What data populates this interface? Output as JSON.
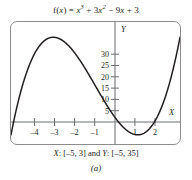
{
  "figure": {
    "title_plain": "f(x) = x^3 + 3x^2 - 9x + 3",
    "title_parts": {
      "fx": "f",
      "paren_open": "(",
      "var1": "x",
      "paren_close": ")",
      "equals": " = ",
      "term1_base": "x",
      "term1_exp": "3",
      "plus1": " + 3",
      "term2_base": "x",
      "term2_exp": "2",
      "minus": " − 9",
      "term3_var": "x",
      "plus2": " + 3"
    },
    "range_caption_prefix": "X",
    "range_caption_x": ": [–5, 3] and ",
    "range_caption_ylabel": "Y",
    "range_caption_y": ": [–5, 35]",
    "panel_label": "(a)",
    "frame_color": "#8c8c8c",
    "curve_color": "#231f20",
    "axis_color": "#6d6e71",
    "background": "#ffffff"
  },
  "chart_data": {
    "type": "line",
    "function": "f(x) = x^3 + 3x^2 - 9x + 3",
    "xlabel": "X",
    "ylabel": "Y",
    "xlim": [
      -5,
      3
    ],
    "ylim": [
      -5,
      35
    ],
    "xticks": [
      -4,
      -3,
      -2,
      -1,
      1,
      2
    ],
    "xtick_labels": [
      "–4",
      "–3",
      "–2",
      "–1",
      "1",
      "2"
    ],
    "yticks": [
      5,
      10,
      15,
      20,
      25,
      30
    ],
    "ytick_labels": [
      "5",
      "10",
      "15",
      "20",
      "25",
      "30"
    ],
    "grid": false,
    "legend": null,
    "features": {
      "local_maximum": {
        "x": -3,
        "y": 30
      },
      "local_minimum": {
        "x": 1,
        "y": -2
      },
      "y_intercept": {
        "x": 0,
        "y": 3
      },
      "x_intercepts": [
        -4.79,
        0.32,
        1.94
      ]
    },
    "x": [
      -5,
      -4.8,
      -4.6,
      -4.4,
      -4.2,
      -4,
      -3.8,
      -3.6,
      -3.4,
      -3.2,
      -3,
      -2.8,
      -2.6,
      -2.4,
      -2.2,
      -2,
      -1.8,
      -1.6,
      -1.4,
      -1.2,
      -1,
      -0.8,
      -0.6,
      -0.4,
      -0.2,
      0,
      0.2,
      0.4,
      0.6,
      0.8,
      1,
      1.2,
      1.4,
      1.6,
      1.8,
      2,
      2.2,
      2.4,
      2.6,
      2.8,
      3
    ],
    "values": [
      -2,
      0.43,
      2.54,
      4.34,
      5.83,
      7,
      7.89,
      8.5,
      8.82,
      8.89,
      8.71,
      8.27,
      7.61,
      6.73,
      5.63,
      4.33,
      2.89,
      1.3,
      -0.4,
      -2.2,
      -4.06,
      -5.99,
      -7.06,
      -6.18,
      -4.64,
      3,
      1.33,
      -0.06,
      -1.06,
      -1.59,
      -2,
      -1.75,
      -0.98,
      0.34,
      2.15,
      4.6,
      7.73,
      11.67,
      16.5,
      22.3,
      30
    ]
  }
}
